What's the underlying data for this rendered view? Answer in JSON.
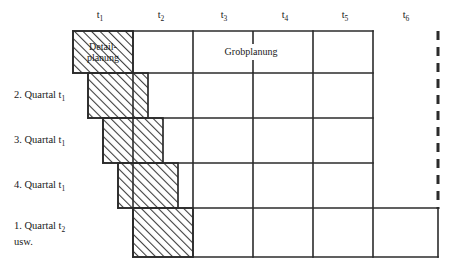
{
  "figure": {
    "type": "rolling-wave-planning-grid",
    "columns": [
      {
        "id": "t1",
        "label": "t",
        "sub": "1",
        "center_x": 100
      },
      {
        "id": "t2",
        "label": "t",
        "sub": "2",
        "center_x": 161
      },
      {
        "id": "t3",
        "label": "t",
        "sub": "3",
        "center_x": 224
      },
      {
        "id": "t4",
        "label": "t",
        "sub": "4",
        "center_x": 285
      },
      {
        "id": "t5",
        "label": "t",
        "sub": "5",
        "center_x": 345
      },
      {
        "id": "t6",
        "label": "t",
        "sub": "6",
        "center_x": 406
      }
    ],
    "rows": [
      {
        "id": "row-1",
        "label": "",
        "sub": "",
        "label2": ""
      },
      {
        "id": "row-2",
        "label": "2. Quartal t",
        "sub": "1",
        "label2": ""
      },
      {
        "id": "row-3",
        "label": "3. Quartal t",
        "sub": "1",
        "label2": ""
      },
      {
        "id": "row-4",
        "label": "4. Quartal t",
        "sub": "1",
        "label2": ""
      },
      {
        "id": "row-5",
        "label": "1. Quartal t",
        "sub": "2",
        "label2": "usw."
      }
    ],
    "annotations": {
      "detailplanung_line1": "Detail-",
      "detailplanung_line2": "planung",
      "grobplanung": "Grobplanung"
    },
    "colors": {
      "line": "#2b2b2b",
      "hatch": "#3a3a3a",
      "background": "#ffffff",
      "text": "#1a1a1a"
    }
  }
}
